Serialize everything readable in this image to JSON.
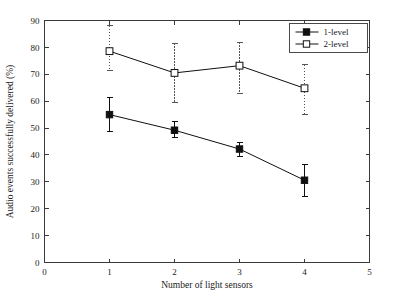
{
  "chart_data": {
    "type": "line",
    "title": "",
    "xlabel": "Number of light sensors",
    "ylabel": "Audio events successfully delivered (%)",
    "xlim": [
      0,
      5
    ],
    "ylim": [
      0,
      90
    ],
    "xticks": [
      "0",
      "1",
      "2",
      "3",
      "4",
      "5"
    ],
    "yticks": [
      "0",
      "10",
      "20",
      "30",
      "40",
      "50",
      "60",
      "70",
      "80",
      "90"
    ],
    "grid": false,
    "legend_position": "top-right",
    "x": [
      1,
      2,
      3,
      4
    ],
    "series": [
      {
        "name": "1-level",
        "marker": "filled-square",
        "errorbar_style": "solid",
        "values": [
          55.0,
          49.2,
          42.2,
          30.6
        ],
        "err_low": [
          48.8,
          46.6,
          39.6,
          24.7
        ],
        "err_high": [
          61.4,
          52.4,
          44.7,
          36.5
        ]
      },
      {
        "name": "2-level",
        "marker": "open-square",
        "errorbar_style": "dotted",
        "values": [
          78.6,
          70.5,
          73.2,
          64.8
        ],
        "err_low": [
          71.3,
          59.4,
          62.9,
          55.0
        ],
        "err_high": [
          88.0,
          81.6,
          81.9,
          73.6
        ]
      }
    ]
  },
  "legend": {
    "entries": [
      {
        "label": "1-level"
      },
      {
        "label": "2-level"
      }
    ]
  }
}
